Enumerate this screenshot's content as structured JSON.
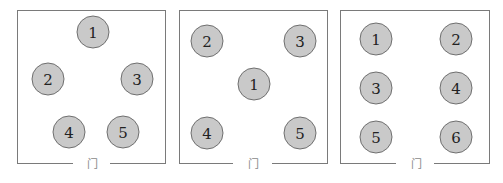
{
  "colors": {
    "wall": "#7a7a7a",
    "seat_fill": "#c9c9c9",
    "seat_border": "#6f6f6f",
    "text": "#222222"
  },
  "door_label": "门",
  "rooms": [
    {
      "id": "room-1",
      "box": {
        "x": 17,
        "y": 10,
        "w": 149,
        "h": 154
      },
      "door": {
        "gap_start": 73,
        "gap_end": 110,
        "label_x": 92
      },
      "seats": [
        {
          "label": "1",
          "cx": 93,
          "cy": 32
        },
        {
          "label": "2",
          "cx": 48,
          "cy": 79
        },
        {
          "label": "3",
          "cx": 137,
          "cy": 79
        },
        {
          "label": "4",
          "cx": 69,
          "cy": 132
        },
        {
          "label": "5",
          "cx": 123,
          "cy": 132
        }
      ]
    },
    {
      "id": "room-2",
      "box": {
        "x": 179,
        "y": 10,
        "w": 149,
        "h": 154
      },
      "door": {
        "gap_start": 233,
        "gap_end": 272,
        "label_x": 253
      },
      "seats": [
        {
          "label": "2",
          "cx": 207,
          "cy": 41
        },
        {
          "label": "3",
          "cx": 300,
          "cy": 41
        },
        {
          "label": "1",
          "cx": 254,
          "cy": 84
        },
        {
          "label": "4",
          "cx": 207,
          "cy": 133
        },
        {
          "label": "5",
          "cx": 300,
          "cy": 133
        }
      ]
    },
    {
      "id": "room-3",
      "box": {
        "x": 340,
        "y": 10,
        "w": 150,
        "h": 154
      },
      "door": {
        "gap_start": 396,
        "gap_end": 434,
        "label_x": 416
      },
      "seats": [
        {
          "label": "1",
          "cx": 376,
          "cy": 39
        },
        {
          "label": "2",
          "cx": 456,
          "cy": 39
        },
        {
          "label": "3",
          "cx": 376,
          "cy": 88
        },
        {
          "label": "4",
          "cx": 456,
          "cy": 88
        },
        {
          "label": "5",
          "cx": 376,
          "cy": 137
        },
        {
          "label": "6",
          "cx": 456,
          "cy": 137
        }
      ]
    }
  ]
}
